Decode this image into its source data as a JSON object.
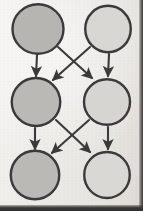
{
  "diagram": {
    "background_color": "#efeeea",
    "ink_color": "#3b3a38",
    "node_fill_dark": "#b6b5b2",
    "node_fill_light": "#d8d7d3",
    "canvas": {
      "width": 143,
      "height": 211
    },
    "nodes": [
      {
        "id": "n-top-left",
        "label": "",
        "row": 0,
        "col": 0,
        "cx": 38,
        "cy": 29,
        "r": 25,
        "fill": "#b6b5b2"
      },
      {
        "id": "n-top-right",
        "label": "",
        "row": 0,
        "col": 1,
        "cx": 108,
        "cy": 29,
        "r": 23,
        "fill": "#d8d7d3"
      },
      {
        "id": "n-mid-left",
        "label": "",
        "row": 1,
        "col": 0,
        "cx": 36,
        "cy": 102,
        "r": 24,
        "fill": "#bab9b6"
      },
      {
        "id": "n-mid-right",
        "label": "",
        "row": 1,
        "col": 1,
        "cx": 107,
        "cy": 102,
        "r": 23,
        "fill": "#d6d5d1"
      },
      {
        "id": "n-bottom-left",
        "label": "",
        "row": 2,
        "col": 0,
        "cx": 35,
        "cy": 175,
        "r": 24,
        "fill": "#bab9b5"
      },
      {
        "id": "n-bottom-right",
        "label": "",
        "row": 2,
        "col": 1,
        "cx": 107,
        "cy": 175,
        "r": 23,
        "fill": "#d9d8d4"
      }
    ],
    "edges": [
      {
        "id": "e-tl-ml",
        "from": "n-top-left",
        "to": "n-mid-left",
        "kind": "vertical",
        "x1": 37,
        "y1": 55,
        "x2": 36,
        "y2": 76
      },
      {
        "id": "e-tr-mr",
        "from": "n-top-right",
        "to": "n-mid-right",
        "kind": "vertical",
        "x1": 109,
        "y1": 54,
        "x2": 108,
        "y2": 76
      },
      {
        "id": "e-tl-mr",
        "from": "n-top-left",
        "to": "n-mid-right",
        "kind": "diagonal",
        "x1": 58,
        "y1": 47,
        "x2": 92,
        "y2": 78
      },
      {
        "id": "e-tr-ml",
        "from": "n-top-right",
        "to": "n-mid-left",
        "kind": "diagonal",
        "x1": 90,
        "y1": 47,
        "x2": 53,
        "y2": 80
      },
      {
        "id": "e-ml-bl",
        "from": "n-mid-left",
        "to": "n-bottom-left",
        "kind": "vertical",
        "x1": 35,
        "y1": 128,
        "x2": 35,
        "y2": 149
      },
      {
        "id": "e-mr-br",
        "from": "n-mid-right",
        "to": "n-bottom-right",
        "kind": "vertical",
        "x1": 108,
        "y1": 127,
        "x2": 108,
        "y2": 149
      },
      {
        "id": "e-ml-br",
        "from": "n-mid-left",
        "to": "n-bottom-right",
        "kind": "diagonal",
        "x1": 56,
        "y1": 120,
        "x2": 90,
        "y2": 152
      },
      {
        "id": "e-mr-bl",
        "from": "n-mid-right",
        "to": "n-bottom-left",
        "kind": "diagonal",
        "x1": 89,
        "y1": 120,
        "x2": 52,
        "y2": 153
      }
    ]
  }
}
